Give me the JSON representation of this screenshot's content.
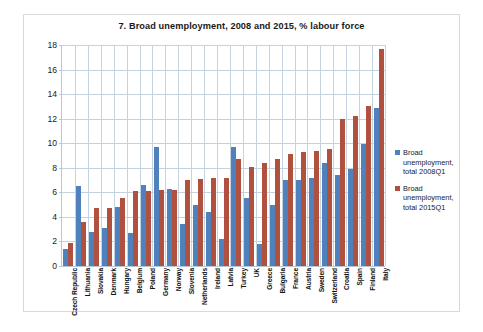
{
  "chart_data": {
    "type": "bar",
    "title": "7. Broad unemployment, 2008 and 2015, % labour force",
    "xlabel": "",
    "ylabel": "",
    "ylim": [
      0,
      18
    ],
    "yticks": [
      0,
      2,
      4,
      6,
      8,
      10,
      12,
      14,
      16,
      18
    ],
    "grid": true,
    "legend_position": "right",
    "categories": [
      "Czech Republic",
      "Lithuania",
      "Slovakia",
      "Denmark",
      "Hungary",
      "Belgium",
      "Poland",
      "Germany",
      "Norway",
      "Slovenia",
      "Netherlands",
      "Ireland",
      "Latvia",
      "Turkey",
      "UK",
      "Greece",
      "Bulgaria",
      "France",
      "Austria",
      "Sweden",
      "Switzerland",
      "Croatia",
      "Spain",
      "Finland",
      "Italy"
    ],
    "series": [
      {
        "name": "Broad unemployment, total 2008Q1",
        "color": "#4f81bd",
        "values": [
          1.4,
          6.5,
          2.8,
          3.1,
          4.8,
          2.7,
          6.6,
          9.7,
          6.3,
          3.4,
          5.0,
          4.4,
          2.2,
          9.7,
          5.5,
          1.8,
          5.0,
          7.0,
          7.0,
          7.2,
          8.4,
          7.4,
          7.9,
          9.9,
          12.9
        ]
      },
      {
        "name": "Broad unemployment, total 2015Q1",
        "color": "#b0503f",
        "values": [
          1.9,
          3.6,
          4.7,
          4.7,
          5.5,
          6.1,
          6.1,
          6.2,
          6.2,
          7.0,
          7.1,
          7.2,
          7.2,
          8.7,
          8.1,
          8.4,
          8.7,
          9.1,
          9.3,
          9.4,
          9.5,
          12.0,
          12.2,
          13.0,
          17.7
        ]
      }
    ]
  },
  "legend": {
    "items": [
      {
        "label": "Broad unemployment, total 2008Q1",
        "color": "#4f81bd"
      },
      {
        "label": "Broad unemployment, total 2015Q1",
        "color": "#b0503f"
      }
    ]
  }
}
